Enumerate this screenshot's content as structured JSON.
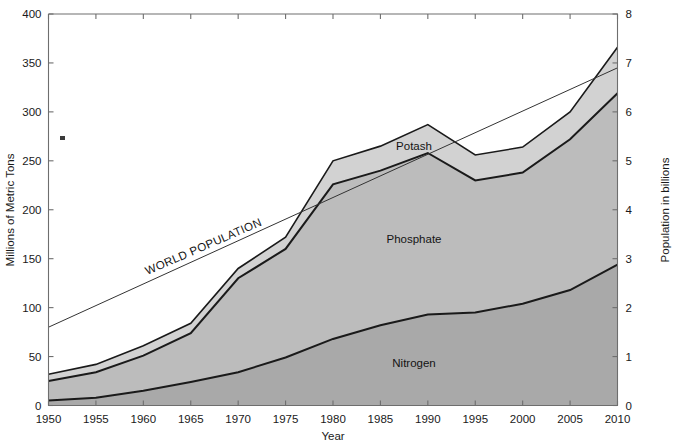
{
  "chart_data": {
    "type": "area",
    "title": "",
    "xlabel": "Year",
    "ylabel": "Millions of Metric Tons",
    "ylabel_right": "Population in billions",
    "stacked": true,
    "grid": false,
    "legend_position": "inline-annotations",
    "x": [
      1950,
      1955,
      1960,
      1965,
      1970,
      1975,
      1980,
      1985,
      1990,
      1995,
      2000,
      2005,
      2010
    ],
    "xlim": [
      1950,
      2010
    ],
    "xticks": [
      1950,
      1955,
      1960,
      1965,
      1970,
      1975,
      1980,
      1985,
      1990,
      1995,
      2000,
      2005,
      2010
    ],
    "xtick_labels": [
      "1950",
      "1955",
      "1960",
      "1965",
      "1970",
      "1975",
      "1980",
      "1985",
      "1990",
      "1995",
      "2000",
      "2005",
      "2010"
    ],
    "ylim": [
      0,
      400
    ],
    "yticks": [
      0,
      50,
      100,
      150,
      200,
      250,
      300,
      350,
      400
    ],
    "ytick_labels": [
      "0",
      "50",
      "100",
      "150",
      "200",
      "250",
      "300",
      "350",
      "400"
    ],
    "ylim_right": [
      0,
      8
    ],
    "yticks_right": [
      0,
      1,
      2,
      3,
      4,
      5,
      6,
      7,
      8
    ],
    "ytick_labels_right": [
      "0",
      "1",
      "2",
      "3",
      "4",
      "5",
      "6",
      "7",
      "8"
    ],
    "series": [
      {
        "name": "Nitrogen",
        "label": "Nitrogen",
        "color": "#a9a9a9",
        "values": [
          5,
          8,
          15,
          24,
          34,
          49,
          68,
          82,
          93,
          95,
          104,
          118,
          144
        ]
      },
      {
        "name": "Phosphate",
        "label": "Phosphate",
        "color": "#bcbcbc",
        "values": [
          20,
          25,
          36,
          47,
          62,
          68,
          78,
          70,
          67,
          55,
          62,
          78,
          75
        ]
      },
      {
        "name": "Potash",
        "label": "Potash",
        "color": "#d2d2d2",
        "values": [
          7,
          9,
          10,
          11,
          16,
          20,
          28,
          28,
          27,
          26,
          28,
          29,
          36
        ]
      }
    ],
    "cumulative_totals": [
      32,
      42,
      61,
      82,
      112,
      137,
      174,
      180,
      187,
      176,
      194,
      225,
      255
    ],
    "stack_tops": {
      "nitrogen": [
        5,
        8,
        15,
        24,
        34,
        49,
        68,
        82,
        93,
        95,
        104,
        118,
        144
      ],
      "phosphate": [
        25,
        33,
        51,
        71,
        96,
        117,
        146,
        152,
        160,
        150,
        166,
        196,
        319
      ],
      "total": [
        32,
        42,
        61,
        82,
        112,
        137,
        174,
        180,
        187,
        176,
        194,
        225,
        366
      ]
    },
    "series_area_tops": {
      "nitrogen_top": [
        5,
        8,
        15,
        24,
        34,
        49,
        68,
        82,
        93,
        95,
        104,
        118,
        144
      ],
      "phosphate_top": [
        25,
        34,
        51,
        74,
        130,
        160,
        226,
        240,
        258,
        230,
        238,
        272,
        319
      ],
      "potash_top": [
        32,
        42,
        61,
        84,
        140,
        172,
        250,
        265,
        287,
        256,
        264,
        300,
        366
      ]
    },
    "world_population_line": {
      "name": "WORLD POPULATION",
      "label": "WORLD POPULATION",
      "units": "billions",
      "x": [
        1950,
        2010
      ],
      "values_billions": [
        1.6,
        6.9
      ],
      "values_left_scale": [
        80,
        345
      ]
    },
    "annotations": [
      {
        "text": "Potash",
        "series": "Potash"
      },
      {
        "text": "Phosphate",
        "series": "Phosphate"
      },
      {
        "text": "Nitrogen",
        "series": "Nitrogen"
      },
      {
        "text": "WORLD POPULATION",
        "series": "World Population"
      }
    ]
  },
  "axes": {
    "x_title": "Year",
    "y_left_title": "Millions of Metric Tons",
    "y_right_title": "Population in billions"
  }
}
